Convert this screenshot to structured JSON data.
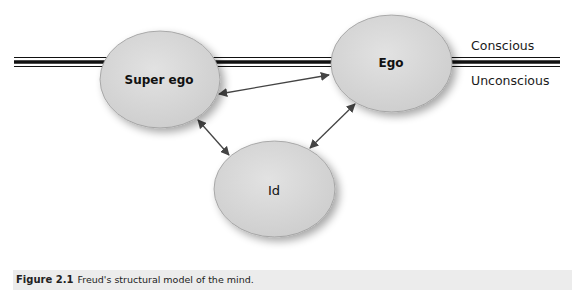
{
  "diagram": {
    "title": "Freud's structural model of the mind",
    "nodes": [
      {
        "id": "superego",
        "label": "Super ego"
      },
      {
        "id": "ego",
        "label": "Ego"
      },
      {
        "id": "id",
        "label": "Id"
      }
    ],
    "edges": [
      {
        "from": "superego",
        "to": "ego",
        "type": "bidirectional"
      },
      {
        "from": "superego",
        "to": "id",
        "type": "bidirectional"
      },
      {
        "from": "ego",
        "to": "id",
        "type": "bidirectional"
      }
    ],
    "zones": {
      "above": "Conscious",
      "below": "Unconscious"
    },
    "colors": {
      "node_fill": "#d6d6d6",
      "node_stroke": "#9a9a9a",
      "line": "#111111",
      "arrow": "#444444",
      "caption_bg": "#ececec"
    }
  },
  "caption": {
    "figure_number": "Figure 2.1",
    "text": "Freud's structural model of the mind."
  }
}
